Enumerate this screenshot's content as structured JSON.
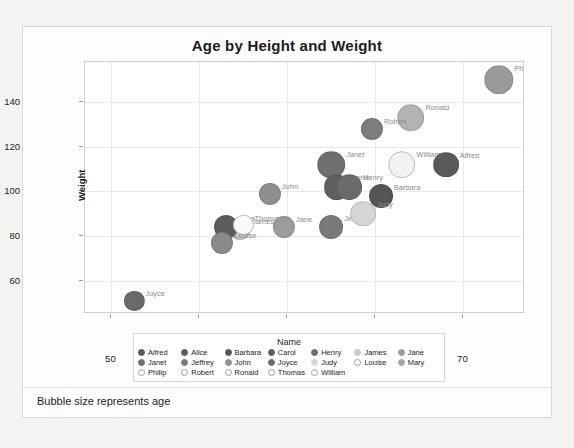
{
  "chart_data": {
    "type": "scatter",
    "title": "Age by Height and Weight",
    "xlabel": "Height",
    "ylabel": "Weight",
    "xlim": [
      48.5,
      73.5
    ],
    "ylim": [
      45,
      158
    ],
    "xticks": [
      50,
      55,
      60,
      65,
      70
    ],
    "yticks": [
      60,
      80,
      100,
      120,
      140
    ],
    "grid": true,
    "legend_title": "Name",
    "legend_position": "bottom",
    "size_note": "Bubble size represents age",
    "points": [
      {
        "name": "Philip",
        "x": 72.0,
        "y": 150,
        "age": 16,
        "color": "#9a9a98",
        "filled": true,
        "label": "Philip"
      },
      {
        "name": "Ronald",
        "x": 67.0,
        "y": 133,
        "age": 15,
        "color": "#b3b3b1",
        "filled": true,
        "label": "Ronald"
      },
      {
        "name": "Robert",
        "x": 64.8,
        "y": 128,
        "age": 12,
        "color": "#7d7d7b",
        "filled": true,
        "label": "Robert"
      },
      {
        "name": "Janet",
        "x": 62.5,
        "y": 112,
        "age": 15,
        "color": "#6f6f6d",
        "filled": true,
        "label": "Janet"
      },
      {
        "name": "William",
        "x": 66.5,
        "y": 112,
        "age": 15,
        "color": "#f2f2f0",
        "filled": false,
        "label": "William"
      },
      {
        "name": "Alfred",
        "x": 69.0,
        "y": 112,
        "age": 14,
        "color": "#5a5a58",
        "filled": true,
        "label": "Alfred"
      },
      {
        "name": "Carol",
        "x": 62.8,
        "y": 102,
        "age": 14,
        "color": "#5f5f5d",
        "filled": true,
        "label": "Carol"
      },
      {
        "name": "Henry",
        "x": 63.5,
        "y": 102,
        "age": 14,
        "color": "#6b6b69",
        "filled": true,
        "label": "Henry"
      },
      {
        "name": "Barbara",
        "x": 65.3,
        "y": 98,
        "age": 13,
        "color": "#555553",
        "filled": true,
        "label": "Barbara"
      },
      {
        "name": "John",
        "x": 59.0,
        "y": 99,
        "age": 12,
        "color": "#8f8f8d",
        "filled": true,
        "label": "John"
      },
      {
        "name": "Jeffrey",
        "x": 62.5,
        "y": 84,
        "age": 13,
        "color": "#7a7a78",
        "filled": true,
        "label": "Jeffrey"
      },
      {
        "name": "James",
        "x": 57.3,
        "y": 83,
        "age": 12,
        "color": "#c9c9c7",
        "filled": true,
        "label": "James"
      },
      {
        "name": "Judy",
        "x": 64.3,
        "y": 90,
        "age": 14,
        "color": "#d5d5d3",
        "filled": true,
        "label": "Judy"
      },
      {
        "name": "Alice",
        "x": 56.5,
        "y": 84,
        "age": 13,
        "color": "#5c5c5a",
        "filled": true,
        "label": "Alice"
      },
      {
        "name": "Thomas",
        "x": 57.5,
        "y": 85,
        "age": 11,
        "color": "#fafaf8",
        "filled": false,
        "label": "Thomas"
      },
      {
        "name": "Jane",
        "x": 59.8,
        "y": 84,
        "age": 12,
        "color": "#9c9c9a",
        "filled": true,
        "label": "Jane"
      },
      {
        "name": "Louise",
        "x": 56.3,
        "y": 77,
        "age": 12,
        "color": "#8a8a88",
        "filled": true,
        "label": "Louise"
      },
      {
        "name": "Joyce",
        "x": 51.3,
        "y": 51,
        "age": 11,
        "color": "#6a6a68",
        "filled": true,
        "label": "Joyce"
      }
    ],
    "legend_entries": [
      {
        "label": "Alfred",
        "color": "#5a5a58",
        "filled": true
      },
      {
        "label": "Alice",
        "color": "#5c5c5a",
        "filled": true
      },
      {
        "label": "Barbara",
        "color": "#555553",
        "filled": true
      },
      {
        "label": "Carol",
        "color": "#5f5f5d",
        "filled": true
      },
      {
        "label": "Henry",
        "color": "#6b6b69",
        "filled": true
      },
      {
        "label": "James",
        "color": "#c9c9c7",
        "filled": true
      },
      {
        "label": "Jane",
        "color": "#9c9c9a",
        "filled": true
      },
      {
        "label": "Janet",
        "color": "#6f6f6d",
        "filled": true
      },
      {
        "label": "Jeffrey",
        "color": "#7a7a78",
        "filled": true
      },
      {
        "label": "John",
        "color": "#8f8f8d",
        "filled": true
      },
      {
        "label": "Joyce",
        "color": "#6a6a68",
        "filled": true
      },
      {
        "label": "Judy",
        "color": "#d5d5d3",
        "filled": true
      },
      {
        "label": "Louise",
        "color": "#8a8a88",
        "filled": false
      },
      {
        "label": "Mary",
        "color": "#a5a5a3",
        "filled": true
      },
      {
        "label": "Philip",
        "color": "#9a9a98",
        "filled": false
      },
      {
        "label": "Robert",
        "color": "#7d7d7b",
        "filled": false
      },
      {
        "label": "Ronald",
        "color": "#b3b3b1",
        "filled": false
      },
      {
        "label": "Thomas",
        "color": "#fafaf8",
        "filled": false
      },
      {
        "label": "William",
        "color": "#f2f2f0",
        "filled": false
      }
    ]
  }
}
